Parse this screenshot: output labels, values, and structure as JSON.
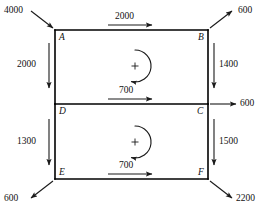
{
  "diagram": {
    "type": "structural-free-body-diagram",
    "background_color": "#ffffff",
    "line_color": "#000000",
    "text_color": "#111111",
    "nodes": [
      {
        "id": "A",
        "label": "A",
        "x": 55,
        "y": 30
      },
      {
        "id": "B",
        "label": "B",
        "x": 208,
        "y": 30
      },
      {
        "id": "C",
        "label": "C",
        "x": 208,
        "y": 104
      },
      {
        "id": "D",
        "label": "D",
        "x": 55,
        "y": 104
      },
      {
        "id": "E",
        "label": "E",
        "x": 55,
        "y": 179
      },
      {
        "id": "F",
        "label": "F",
        "x": 208,
        "y": 179
      }
    ],
    "members": [
      {
        "name": "member-AB",
        "from": "A",
        "to": "B"
      },
      {
        "name": "member-BC",
        "from": "B",
        "to": "C"
      },
      {
        "name": "member-DC",
        "from": "D",
        "to": "C"
      },
      {
        "name": "member-AD",
        "from": "A",
        "to": "D"
      },
      {
        "name": "member-DE",
        "from": "D",
        "to": "E"
      },
      {
        "name": "member-CF",
        "from": "C",
        "to": "F"
      },
      {
        "name": "member-EF",
        "from": "E",
        "to": "F"
      }
    ],
    "forces": [
      {
        "name": "force-top-left-4000",
        "value": "4000",
        "at_node": "A",
        "direction": "into-corner-down-right",
        "orientation": "diagonal"
      },
      {
        "name": "force-top-ab-2000",
        "value": "2000",
        "at_node": "A",
        "direction": "right",
        "orientation": "horizontal"
      },
      {
        "name": "force-top-right-600",
        "value": "600",
        "at_node": "B",
        "direction": "out-up-right",
        "orientation": "diagonal"
      },
      {
        "name": "force-left-ad-2000",
        "value": "2000",
        "at_node": "A",
        "direction": "down",
        "orientation": "vertical"
      },
      {
        "name": "force-right-bc-1400",
        "value": "1400",
        "at_node": "B",
        "direction": "down",
        "orientation": "vertical"
      },
      {
        "name": "force-mid-dc-700",
        "value": "700",
        "at_node": "D",
        "direction": "right",
        "orientation": "horizontal"
      },
      {
        "name": "force-mid-right-600",
        "value": "600",
        "at_node": "C",
        "direction": "right",
        "orientation": "horizontal"
      },
      {
        "name": "force-left-de-1300",
        "value": "1300",
        "at_node": "D",
        "direction": "down",
        "orientation": "vertical"
      },
      {
        "name": "force-right-cf-1500",
        "value": "1500",
        "at_node": "C",
        "direction": "down",
        "orientation": "vertical"
      },
      {
        "name": "force-bottom-left-600",
        "value": "600",
        "at_node": "E",
        "direction": "out-down-left",
        "orientation": "diagonal"
      },
      {
        "name": "force-bottom-ef-700",
        "value": "700",
        "at_node": "E",
        "direction": "right",
        "orientation": "horizontal"
      },
      {
        "name": "force-bottom-right-2200",
        "value": "2200",
        "at_node": "F",
        "direction": "out-down-right",
        "orientation": "diagonal"
      }
    ],
    "moments": [
      {
        "name": "moment-upper-panel",
        "sign": "+",
        "sense": "clockwise",
        "panel": "ABCD",
        "cx": 135,
        "cy": 66
      },
      {
        "name": "moment-lower-panel",
        "sign": "+",
        "sense": "clockwise",
        "panel": "DCFE",
        "cx": 135,
        "cy": 142
      }
    ]
  }
}
